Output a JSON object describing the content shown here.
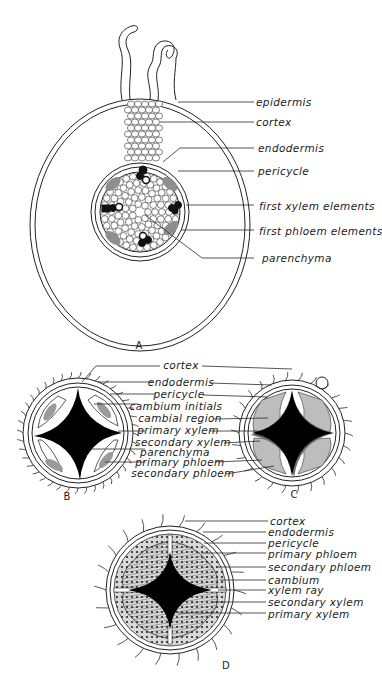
{
  "figure": {
    "panels": [
      {
        "id": "A",
        "label": "A",
        "description": "young root cross-section with root hairs",
        "labels": [
          "epidermis",
          "cortex",
          "endodermis",
          "pericycle",
          "first xylem elements",
          "first phloem elements",
          "parenchyma"
        ]
      },
      {
        "id": "B",
        "label": "B",
        "description": "stele at onset of secondary growth"
      },
      {
        "id": "C",
        "label": "C",
        "description": "stele with cambial region and secondary tissues"
      },
      {
        "id": "BC_shared",
        "labels": [
          "cortex",
          "endodermis",
          "pericycle",
          "cambium initials",
          "cambial region",
          "primary xylem",
          "secondary xylem",
          "parenchyma",
          "primary phloem",
          "secondary phloem"
        ]
      },
      {
        "id": "D",
        "label": "D",
        "description": "root after further secondary growth",
        "labels": [
          "cortex",
          "endodermis",
          "pericycle",
          "primary phloem",
          "secondary phloem",
          "cambium",
          "xylem ray",
          "secondary xylem",
          "primary xylem"
        ]
      }
    ]
  },
  "colors": {
    "ink": "#1a1a1a",
    "background": "#ffffff",
    "shade": "#9a9a9a"
  }
}
